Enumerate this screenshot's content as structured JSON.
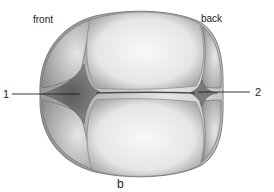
{
  "figure": {
    "panel_label": "b",
    "orientation_labels": {
      "front": "front",
      "back": "back"
    },
    "callouts": [
      {
        "number": "1",
        "target": "anterior-fontanelle",
        "side": "left"
      },
      {
        "number": "2",
        "target": "posterior-fontanelle",
        "side": "right"
      }
    ],
    "colors": {
      "background": "#ffffff",
      "bone_light": "#f2f2f2",
      "bone_shade": "#bdbdbd",
      "fontanelle": "#6a6a6a",
      "outline": "#555555",
      "leader_line": "#222222"
    }
  }
}
